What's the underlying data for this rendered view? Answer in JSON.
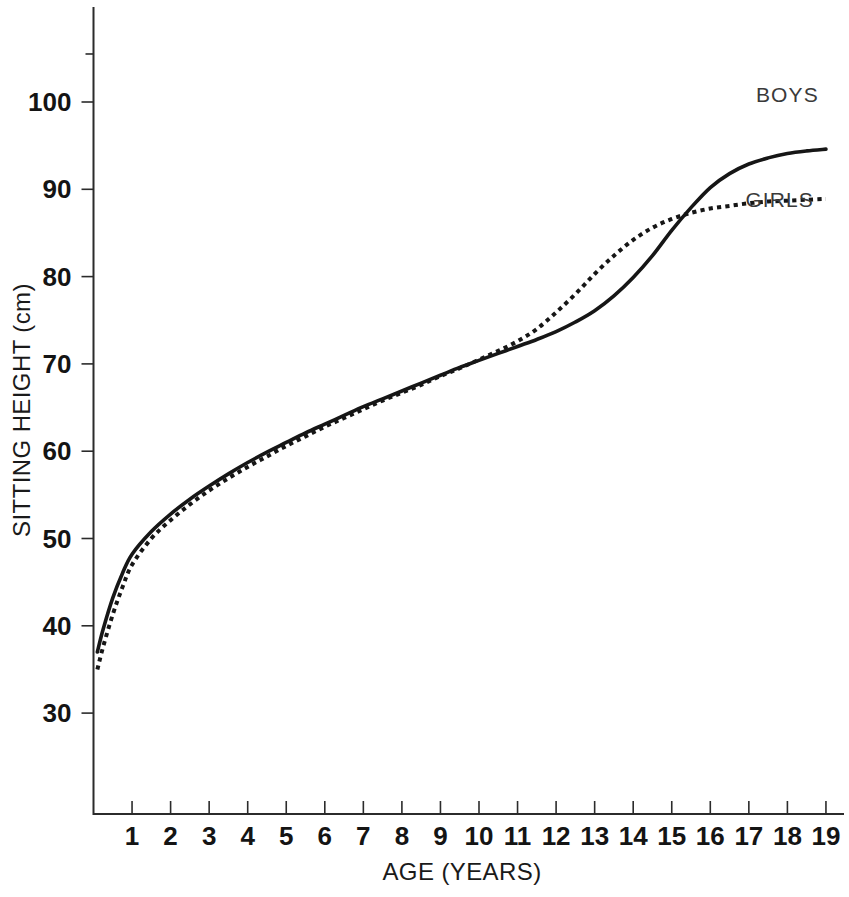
{
  "chart_data": {
    "type": "line",
    "title": "",
    "xlabel": "AGE (YEARS)",
    "ylabel": "SITTING HEIGHT (cm)",
    "xlim": [
      0,
      19.3
    ],
    "ylim": [
      22,
      108.5
    ],
    "grid": false,
    "legend_position": "right-inline",
    "xticks": [
      1,
      2,
      3,
      4,
      5,
      6,
      7,
      8,
      9,
      10,
      11,
      12,
      13,
      14,
      15,
      16,
      17,
      18,
      19
    ],
    "yticks": [
      30,
      40,
      50,
      60,
      70,
      80,
      90,
      100
    ],
    "series": [
      {
        "name": "BOYS",
        "style": "solid",
        "color": "#161616",
        "label_x": 18.0,
        "label_y": 100.0,
        "x": [
          0.1,
          0.25,
          0.5,
          0.75,
          1.0,
          1.5,
          2.0,
          2.5,
          3.0,
          3.5,
          4.0,
          4.5,
          5.0,
          5.5,
          6.0,
          6.5,
          7.0,
          7.5,
          8.0,
          8.5,
          9.0,
          9.5,
          10.0,
          10.5,
          11.0,
          11.5,
          12.0,
          12.5,
          13.0,
          13.5,
          14.0,
          14.5,
          15.0,
          15.5,
          16.0,
          16.5,
          17.0,
          17.5,
          18.0,
          18.5,
          19.0
        ],
        "y": [
          37.0,
          39.6,
          43.2,
          46.0,
          48.2,
          50.8,
          52.8,
          54.5,
          56.0,
          57.4,
          58.7,
          59.9,
          61.0,
          62.1,
          63.1,
          64.1,
          65.1,
          66.0,
          66.9,
          67.8,
          68.7,
          69.6,
          70.4,
          71.2,
          72.0,
          72.8,
          73.7,
          74.8,
          76.1,
          77.8,
          79.9,
          82.4,
          85.3,
          87.9,
          90.2,
          91.8,
          92.9,
          93.6,
          94.1,
          94.4,
          94.6
        ]
      },
      {
        "name": "GIRLS",
        "style": "dotted",
        "color": "#161616",
        "label_x": 17.8,
        "label_y": 88.0,
        "x": [
          0.1,
          0.25,
          0.5,
          0.75,
          1.0,
          1.5,
          2.0,
          2.5,
          3.0,
          3.5,
          4.0,
          4.5,
          5.0,
          5.5,
          6.0,
          6.5,
          7.0,
          7.5,
          8.0,
          8.5,
          9.0,
          9.5,
          10.0,
          10.5,
          11.0,
          11.5,
          12.0,
          12.5,
          13.0,
          13.5,
          14.0,
          14.5,
          15.0,
          15.5,
          16.0,
          16.5,
          17.0,
          17.5,
          18.0,
          18.5,
          19.0
        ],
        "y": [
          35.0,
          37.6,
          41.3,
          44.4,
          47.0,
          50.0,
          52.1,
          53.9,
          55.5,
          56.9,
          58.2,
          59.4,
          60.6,
          61.7,
          62.8,
          63.8,
          64.8,
          65.8,
          66.7,
          67.6,
          68.6,
          69.5,
          70.5,
          71.5,
          72.6,
          74.0,
          75.9,
          78.0,
          80.3,
          82.4,
          84.2,
          85.6,
          86.6,
          87.3,
          87.8,
          88.1,
          88.4,
          88.6,
          88.7,
          88.8,
          88.9
        ]
      }
    ]
  },
  "labels": {
    "x_axis_title": "AGE (YEARS)",
    "y_axis_title": "SITTING HEIGHT (cm)",
    "boys_label": "BOYS",
    "girls_label": "GIRLS"
  }
}
